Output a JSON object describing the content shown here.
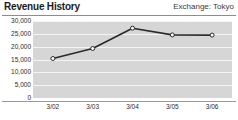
{
  "header": {
    "title": "Revenue History",
    "exchange_label": "Exchange: Tokyo"
  },
  "chart_data": {
    "type": "line",
    "title": "Revenue History",
    "subtitle": "Exchange: Tokyo",
    "xlabel": "",
    "ylabel": "",
    "categories": [
      "3/02",
      "3/03",
      "3/04",
      "3/05",
      "3/06"
    ],
    "values": [
      15400,
      19300,
      27200,
      24600,
      24500
    ],
    "series": [
      {
        "name": "Revenue",
        "values": [
          15400,
          19300,
          27200,
          24600,
          24500
        ]
      }
    ],
    "ylim": [
      0,
      30000
    ],
    "yticks": [
      0,
      5000,
      10000,
      15000,
      20000,
      25000,
      30000
    ],
    "ytick_labels": [
      "0",
      "5,000",
      "10,000",
      "15,000",
      "20,000",
      "25,000",
      "30,000"
    ],
    "xtick_labels": [
      "3/02",
      "3/03",
      "3/04",
      "3/05",
      "3/06"
    ],
    "grid": true,
    "legend": false,
    "legend_position": "none",
    "marker": "open-circle",
    "line_color": "#2a2a2a",
    "marker_fill": "#ffffff",
    "plot_background": "#d6d6d6",
    "gridline_color": "#f4f4f4"
  }
}
